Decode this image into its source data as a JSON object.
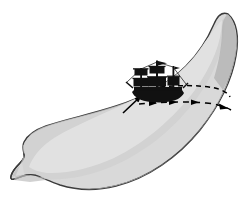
{
  "figure": {
    "kind": "illustration",
    "alt_text": "A gray crescent or banana shaped form with a black sailing ship on its inner upper edge and dashed arrows pointing right",
    "background_color": "#ffffff"
  },
  "banana": {
    "label": "banana-shape",
    "outline_color": "#3b3b3b",
    "outline_width": "1.4",
    "light_fill": "#d9d9d9",
    "mid_fill": "#cfcfcf",
    "dark_fill": "#a9a9a9",
    "highlight_fill": "#e6e6e6",
    "tip_top_label": "top-tip",
    "tip_bottom_label": "bottom-tip-notch"
  },
  "ship": {
    "label": "sailing-ship",
    "color": "#111111",
    "mast_count": "3",
    "sail_count": "5",
    "hull_label": "ship-hull",
    "mast_labels": [
      "foremast",
      "mainmast",
      "mizzenmast"
    ],
    "flag_label": "masthead-flag"
  },
  "motion": {
    "label": "motion-arrows",
    "color": "#000000",
    "dash_pattern": "5 4",
    "upper_line_label": "upper-dashed-path",
    "lower_line_label": "lower-dashed-arrow-path",
    "arrowhead_count": "4",
    "diagonal_arrow_label": "diagonal-up-right-arrow",
    "direction": "rightward"
  }
}
